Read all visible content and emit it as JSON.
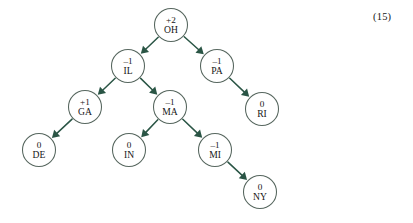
{
  "figure": {
    "equation_number": "(15)",
    "colors": {
      "edge": "#2a5545",
      "node_stroke": "#56665e",
      "node_fill": "#ffffff",
      "text": "#161616",
      "background": "#ffffff"
    },
    "nodes": [
      {
        "id": "OH",
        "value": "+2",
        "name": "OH",
        "cx": 171,
        "cy": 25,
        "r": 16.5
      },
      {
        "id": "IL",
        "value": "–1",
        "name": "IL",
        "cx": 128,
        "cy": 66,
        "r": 16.5
      },
      {
        "id": "PA",
        "value": "–1",
        "name": "PA",
        "cx": 217,
        "cy": 66,
        "r": 16.5
      },
      {
        "id": "GA",
        "value": "+1",
        "name": "GA",
        "cx": 85,
        "cy": 107,
        "r": 16.5
      },
      {
        "id": "MA",
        "value": "–1",
        "name": "MA",
        "cx": 170,
        "cy": 107,
        "r": 16.5
      },
      {
        "id": "RI",
        "value": "0",
        "name": "RI",
        "cx": 262,
        "cy": 109,
        "r": 16.5
      },
      {
        "id": "DE",
        "value": "0",
        "name": "DE",
        "cx": 39,
        "cy": 150,
        "r": 16.5
      },
      {
        "id": "IN",
        "value": "0",
        "name": "IN",
        "cx": 129,
        "cy": 150,
        "r": 16.5
      },
      {
        "id": "MI",
        "value": "–1",
        "name": "MI",
        "cx": 215,
        "cy": 150,
        "r": 16.5
      },
      {
        "id": "NY",
        "value": "0",
        "name": "NY",
        "cx": 260,
        "cy": 192,
        "r": 16.5
      }
    ],
    "edges": [
      {
        "from": "OH",
        "to": "IL"
      },
      {
        "from": "OH",
        "to": "PA"
      },
      {
        "from": "IL",
        "to": "GA"
      },
      {
        "from": "IL",
        "to": "MA"
      },
      {
        "from": "PA",
        "to": "RI"
      },
      {
        "from": "GA",
        "to": "DE"
      },
      {
        "from": "MA",
        "to": "IN"
      },
      {
        "from": "MA",
        "to": "MI"
      },
      {
        "from": "MI",
        "to": "NY"
      }
    ]
  }
}
